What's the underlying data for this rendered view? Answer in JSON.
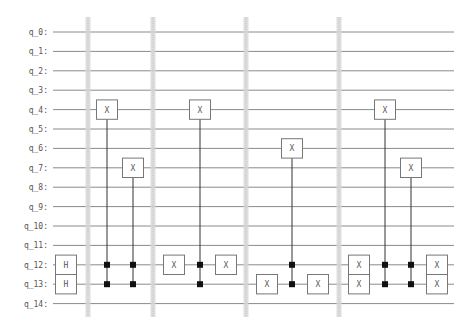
{
  "diagram": {
    "type": "quantum-circuit",
    "colors": {
      "wire": "#8a8a8a",
      "barrier": "#d8d8d8",
      "gate_border": "#777777",
      "gate_fill": "#ffffff",
      "control": "#111111",
      "connector": "#333333",
      "text": "#555555"
    },
    "qubits": [
      "q_0:",
      "q_1:",
      "q_2:",
      "q_3:",
      "q_4:",
      "q_5:",
      "q_6:",
      "q_7:",
      "q_8:",
      "q_9:",
      "q_10:",
      "q_11:",
      "q_12:",
      "q_13:",
      "q_14:"
    ],
    "barriers_x": [
      88,
      153,
      246,
      339
    ],
    "gates": [
      {
        "label": "H",
        "qubit": 12,
        "x": 66
      },
      {
        "label": "H",
        "qubit": 13,
        "x": 66
      },
      {
        "label": "X",
        "qubit": 4,
        "x": 107
      },
      {
        "label": "X",
        "qubit": 7,
        "x": 133
      },
      {
        "label": "X",
        "qubit": 12,
        "x": 174
      },
      {
        "label": "X",
        "qubit": 4,
        "x": 200
      },
      {
        "label": "X",
        "qubit": 12,
        "x": 226
      },
      {
        "label": "X",
        "qubit": 13,
        "x": 267
      },
      {
        "label": "X",
        "qubit": 6,
        "x": 292
      },
      {
        "label": "X",
        "qubit": 13,
        "x": 318
      },
      {
        "label": "X",
        "qubit": 12,
        "x": 359
      },
      {
        "label": "X",
        "qubit": 13,
        "x": 359
      },
      {
        "label": "X",
        "qubit": 4,
        "x": 385
      },
      {
        "label": "X",
        "qubit": 7,
        "x": 411
      },
      {
        "label": "X",
        "qubit": 12,
        "x": 437
      },
      {
        "label": "X",
        "qubit": 13,
        "x": 437
      }
    ],
    "multi_controlled": [
      {
        "name": "ccx-1",
        "x": 107,
        "controls": [
          12,
          13
        ],
        "target": 4
      },
      {
        "name": "ccx-2",
        "x": 133,
        "controls": [
          12,
          13
        ],
        "target": 7
      },
      {
        "name": "ccx-3",
        "x": 200,
        "controls": [
          12,
          13
        ],
        "target": 4
      },
      {
        "name": "ccx-4",
        "x": 292,
        "controls": [
          12,
          13
        ],
        "target": 6
      },
      {
        "name": "ccx-5",
        "x": 385,
        "controls": [
          12,
          13
        ],
        "target": 4
      },
      {
        "name": "ccx-6",
        "x": 411,
        "controls": [
          12,
          13
        ],
        "target": 7
      }
    ]
  }
}
